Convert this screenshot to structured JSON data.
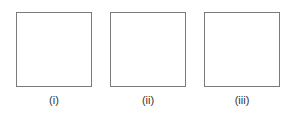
{
  "figure": {
    "panels": [
      {
        "label": "(i)"
      },
      {
        "label": "(ii)"
      },
      {
        "label": "(iii)"
      }
    ],
    "colors": {
      "border": "#7a7a7a",
      "text": "#333333",
      "background": "#ffffff"
    }
  }
}
